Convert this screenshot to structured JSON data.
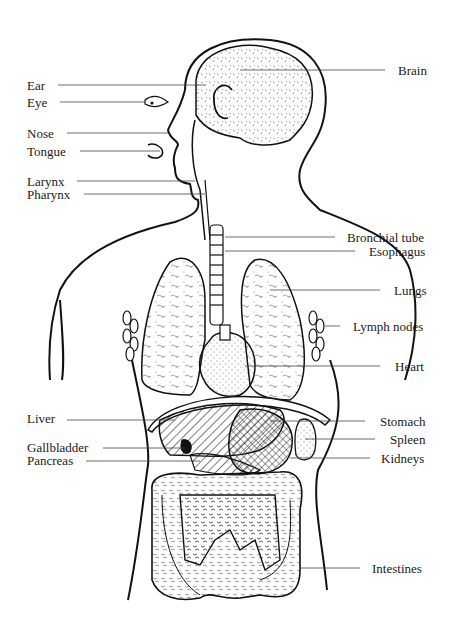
{
  "diagram": {
    "labels_left": [
      {
        "id": "ear",
        "text": "Ear",
        "y": 85
      },
      {
        "id": "eye",
        "text": "Eye",
        "y": 102
      },
      {
        "id": "nose",
        "text": "Nose",
        "y": 133
      },
      {
        "id": "tongue",
        "text": "Tongue",
        "y": 151
      },
      {
        "id": "larynx",
        "text": "Larynx",
        "y": 181
      },
      {
        "id": "pharynx",
        "text": "Pharynx",
        "y": 194
      },
      {
        "id": "liver",
        "text": "Liver",
        "y": 418
      },
      {
        "id": "gallbladder",
        "text": "Gallbladder",
        "y": 447
      },
      {
        "id": "pancreas",
        "text": "Pancreas",
        "y": 460
      }
    ],
    "labels_right": [
      {
        "id": "brain",
        "text": "Brain",
        "y": 70
      },
      {
        "id": "bronchial-tube",
        "text": "Bronchial tube",
        "y": 237
      },
      {
        "id": "esophagus",
        "text": "Esophagus",
        "y": 251
      },
      {
        "id": "lungs",
        "text": "Lungs",
        "y": 290
      },
      {
        "id": "lymph-nodes",
        "text": "Lymph nodes",
        "y": 326
      },
      {
        "id": "heart",
        "text": "Heart",
        "y": 366
      },
      {
        "id": "stomach",
        "text": "Stomach",
        "y": 421
      },
      {
        "id": "spleen",
        "text": "Spleen",
        "y": 439
      },
      {
        "id": "kidneys",
        "text": "Kidneys",
        "y": 458
      },
      {
        "id": "intestines",
        "text": "Intestines",
        "y": 568
      }
    ]
  }
}
